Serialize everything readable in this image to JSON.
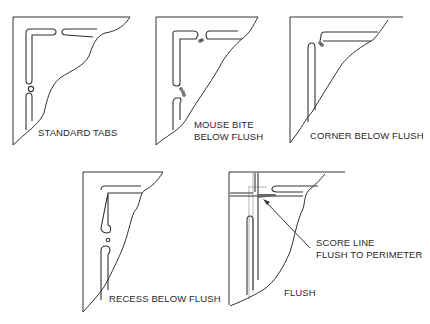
{
  "figure": {
    "panels": [
      {
        "id": "standard-tabs",
        "label_lines": [
          "STANDARD  TABS"
        ]
      },
      {
        "id": "mouse-bite-below-flush",
        "label_lines": [
          "MOUSE BITE",
          "BELOW FLUSH"
        ]
      },
      {
        "id": "corner-below-flush",
        "label_lines": [
          "CORNER BELOW FLUSH"
        ]
      },
      {
        "id": "recess-below-flush",
        "label_lines": [
          "RECESS BELOW FLUSH"
        ]
      },
      {
        "id": "flush",
        "label_lines": [
          "FLUSH"
        ],
        "callout": [
          "SCORE LINE",
          "FLUSH TO PERIMETER"
        ]
      }
    ],
    "line_color": "#333333",
    "background": "#ffffff"
  }
}
